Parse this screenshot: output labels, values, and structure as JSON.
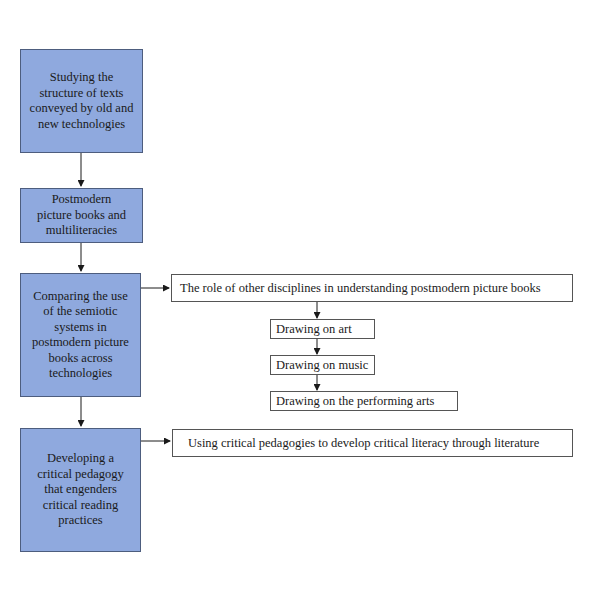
{
  "diagram": {
    "main_steps": [
      {
        "label": "Studying the structure of texts conveyed by old and new technologies"
      },
      {
        "label": "Postmodern picture books and multiliteracies"
      },
      {
        "label": "Comparing the use of the semiotic systems in postmodern picture books across technologies"
      },
      {
        "label": "Developing a critical pedagogy that engenders critical reading practices"
      }
    ],
    "branch_comparing": {
      "label": "The role of other disciplines in understanding postmodern picture books",
      "sub_steps": [
        {
          "label": "Drawing on art"
        },
        {
          "label": "Drawing on music"
        },
        {
          "label": "Drawing on the performing arts"
        }
      ]
    },
    "branch_developing": {
      "label": "Using critical pedagogies to develop critical literacy through literature"
    },
    "colors": {
      "main_box_fill": "#8fa9de",
      "main_box_border": "#4d5d7e",
      "side_box_fill": "#ffffff",
      "arrow": "#1a1a1a"
    }
  }
}
